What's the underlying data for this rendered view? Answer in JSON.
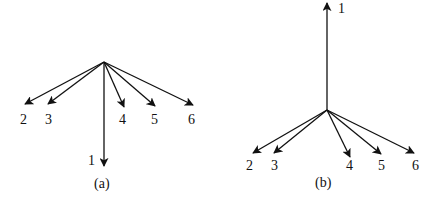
{
  "figure": {
    "stroke_color": "#111111",
    "background": "#ffffff",
    "panels": [
      {
        "id": "a",
        "caption": "(a)",
        "description": "Six vectors from a common origin; vector 1 points downward, vectors 2-6 fan downward to the sides",
        "vectors": [
          {
            "label": "1",
            "direction": "down"
          },
          {
            "label": "2",
            "direction": "down-left"
          },
          {
            "label": "3",
            "direction": "down-left"
          },
          {
            "label": "4",
            "direction": "down-right"
          },
          {
            "label": "5",
            "direction": "down-right"
          },
          {
            "label": "6",
            "direction": "down-right"
          }
        ]
      },
      {
        "id": "b",
        "caption": "(b)",
        "description": "Six vectors from a common origin; vector 1 points upward, vectors 2-6 fan downward to the sides",
        "vectors": [
          {
            "label": "1",
            "direction": "up"
          },
          {
            "label": "2",
            "direction": "down-left"
          },
          {
            "label": "3",
            "direction": "down-left"
          },
          {
            "label": "4",
            "direction": "down-right"
          },
          {
            "label": "5",
            "direction": "down-right"
          },
          {
            "label": "6",
            "direction": "down-right"
          }
        ]
      }
    ]
  }
}
